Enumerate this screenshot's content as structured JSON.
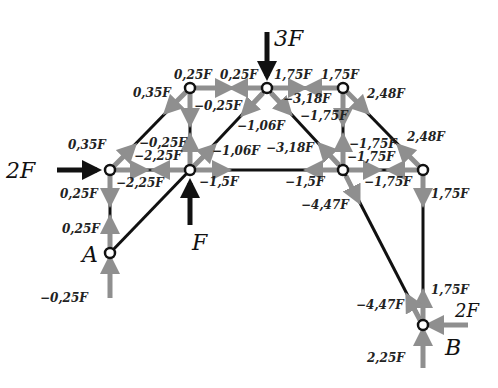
{
  "diagram": {
    "type": "truss-force-diagram",
    "colors": {
      "member": "#111111",
      "force_arrow": "#8f8f8f",
      "load": "#111111"
    },
    "nodes": {
      "A": {
        "label": "A",
        "x": 110,
        "y": 253
      },
      "L": {
        "x": 110,
        "y": 170
      },
      "TL": {
        "x": 190,
        "y": 88
      },
      "C": {
        "x": 190,
        "y": 170
      },
      "TM": {
        "x": 267,
        "y": 88
      },
      "TR": {
        "x": 343,
        "y": 88
      },
      "R": {
        "x": 343,
        "y": 170
      },
      "RR": {
        "x": 423,
        "y": 170
      },
      "B": {
        "label": "B",
        "x": 423,
        "y": 325
      }
    },
    "loads": {
      "top": "3F",
      "left": "2F",
      "center": "F",
      "right": "2F"
    },
    "labels": {
      "l_0_35F_top": "0,35F",
      "l_0_25F_tl": "0,25F",
      "l_0_25F_tm": "0,25F",
      "l_1_75F_tm": "1,75F",
      "l_1_75F_tr": "1,75F",
      "l_neg0_25F_vert": "−0,25F",
      "l_neg3_18F_top": "−3,18F",
      "l_neg1_75F_vert_top": "−1,75F",
      "l_2_48F_top": "2,48F",
      "l_neg1_06F_top": "−1,06F",
      "l_0_35F_bot": "0,35F",
      "l_neg0_25F_c": "−0,25F",
      "l_neg2_25F_top": "−2,25F",
      "l_neg1_06F_c": "−1,06F",
      "l_neg3_18F_bot": "−3,18F",
      "l_neg1_75F_vert_bot": "−1,75F",
      "l_neg1_75F_horiz_top": "−1,75F",
      "l_2_48F_bot": "2,48F",
      "l_neg2_25F_bot": "−2,25F",
      "l_neg1_5F_c": "−1,5F",
      "l_neg1_5F_r": "−1,5F",
      "l_neg1_75F_horiz_bot": "−1,75F",
      "l_0_25F_left_top": "0,25F",
      "l_1_75F_right": "1,75F",
      "l_neg4_47F_top": "−4,47F",
      "l_0_25F_left_bot": "0,25F",
      "l_neg0_25F_A": "−0,25F",
      "l_neg4_47F_B": "−4,47F",
      "l_1_75F_B": "1,75F",
      "l_2_25F_B": "2,25F"
    }
  }
}
